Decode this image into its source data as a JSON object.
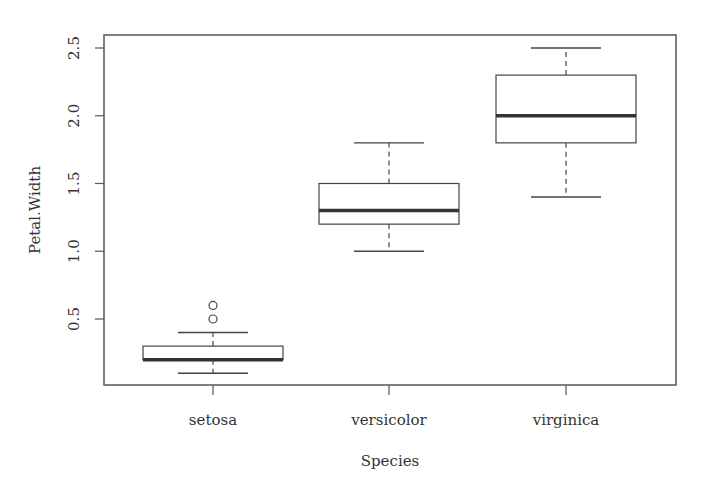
{
  "chart_data": {
    "type": "boxplot",
    "title": "",
    "xlabel": "Species",
    "ylabel": "Petal.Width",
    "categories": [
      "setosa",
      "versicolor",
      "virginica"
    ],
    "boxes": [
      {
        "name": "setosa",
        "whisker_low": 0.1,
        "q1": 0.2,
        "median": 0.2,
        "q3": 0.3,
        "whisker_high": 0.4,
        "outliers": [
          0.5,
          0.6
        ]
      },
      {
        "name": "versicolor",
        "whisker_low": 1.0,
        "q1": 1.2,
        "median": 1.3,
        "q3": 1.5,
        "whisker_high": 1.8,
        "outliers": []
      },
      {
        "name": "virginica",
        "whisker_low": 1.4,
        "q1": 1.8,
        "median": 2.0,
        "q3": 2.3,
        "whisker_high": 2.5,
        "outliers": []
      }
    ],
    "yticks": [
      0.5,
      1.0,
      1.5,
      2.0,
      2.5
    ],
    "ytick_labels": [
      "0.5",
      "1.0",
      "1.5",
      "2.0",
      "2.5"
    ],
    "ylim": [
      0.1,
      2.5
    ],
    "grid": false,
    "legend": null
  },
  "colors": {
    "frame": "#555555",
    "box": "#444444",
    "median": "#333333",
    "text": "#333333"
  }
}
